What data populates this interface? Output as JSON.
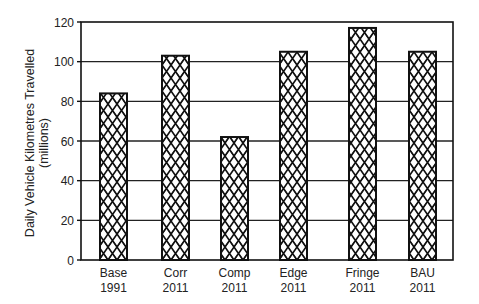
{
  "chart_data": {
    "type": "bar",
    "title": "",
    "xlabel": "",
    "ylabel": "Daily Vehicle Kilometres Travelled",
    "ylabel_sub": "(millions)",
    "categories": [
      [
        "Base",
        "1991"
      ],
      [
        "Corr",
        "2011"
      ],
      [
        "Comp",
        "2011"
      ],
      [
        "Edge",
        "2011"
      ],
      [
        "Fringe",
        "2011"
      ],
      [
        "BAU",
        "2011"
      ]
    ],
    "values": [
      84,
      103,
      62,
      105,
      117,
      105
    ],
    "ylim": [
      0,
      120
    ],
    "yticks": [
      0,
      20,
      40,
      60,
      80,
      100,
      120
    ],
    "grid": true,
    "legend": null,
    "bar_fill": "crosshatch",
    "colors": {
      "bar_stroke": "#111111",
      "grid": "#222222",
      "axis": "#111111"
    }
  }
}
